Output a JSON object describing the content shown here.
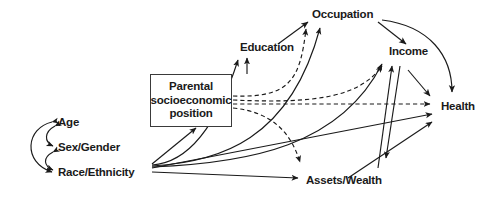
{
  "diagram": {
    "type": "directed-acyclic-graph",
    "stroke_color": "#1a1a1a",
    "text_color": "#1a1a1a",
    "background": "#ffffff",
    "nodes": [
      {
        "id": "age",
        "label": "Age",
        "x": 58,
        "y": 122
      },
      {
        "id": "sex",
        "label": "Sex/Gender",
        "x": 58,
        "y": 147
      },
      {
        "id": "race",
        "label": "Race/Ethnicity",
        "x": 58,
        "y": 172
      },
      {
        "id": "parental",
        "label": "Parental socioeconomic position",
        "x": 151,
        "y": 75
      },
      {
        "id": "education",
        "label": "Education",
        "x": 240,
        "y": 47
      },
      {
        "id": "occupation",
        "label": "Occupation",
        "x": 312,
        "y": 14
      },
      {
        "id": "income",
        "label": "Income",
        "x": 389,
        "y": 51
      },
      {
        "id": "health",
        "label": "Health",
        "x": 441,
        "y": 106
      },
      {
        "id": "assets",
        "label": "Assets/Wealth",
        "x": 306,
        "y": 180
      }
    ],
    "parental_box": {
      "line1": "Parental",
      "line2": "socioeconomic",
      "line3": "position",
      "x": 150,
      "y": 74,
      "width": 82,
      "height": 53
    },
    "edges": [
      {
        "from": "age",
        "to": "sex",
        "style": "curved-bidirectional"
      },
      {
        "from": "sex",
        "to": "race",
        "style": "curved-bidirectional"
      },
      {
        "from": "age",
        "to": "race",
        "style": "curved-bidirectional"
      },
      {
        "from": "race",
        "to": "parental",
        "style": "solid"
      },
      {
        "from": "race",
        "to": "education",
        "style": "solid"
      },
      {
        "from": "race",
        "to": "occupation",
        "style": "solid"
      },
      {
        "from": "race",
        "to": "income",
        "style": "solid"
      },
      {
        "from": "race",
        "to": "health",
        "style": "solid"
      },
      {
        "from": "race",
        "to": "assets",
        "style": "solid"
      },
      {
        "from": "parental",
        "to": "education",
        "style": "solid"
      },
      {
        "from": "parental",
        "to": "occupation",
        "style": "dashed"
      },
      {
        "from": "parental",
        "to": "income",
        "style": "dashed"
      },
      {
        "from": "parental",
        "to": "health",
        "style": "dashed"
      },
      {
        "from": "parental",
        "to": "assets",
        "style": "dashed"
      },
      {
        "from": "education",
        "to": "occupation",
        "style": "solid"
      },
      {
        "from": "occupation",
        "to": "income",
        "style": "solid"
      },
      {
        "from": "occupation",
        "to": "health",
        "style": "solid-curved"
      },
      {
        "from": "income",
        "to": "assets",
        "style": "solid"
      },
      {
        "from": "income",
        "to": "health",
        "style": "solid"
      },
      {
        "from": "assets",
        "to": "income",
        "style": "solid"
      },
      {
        "from": "assets",
        "to": "health",
        "style": "solid"
      }
    ]
  }
}
